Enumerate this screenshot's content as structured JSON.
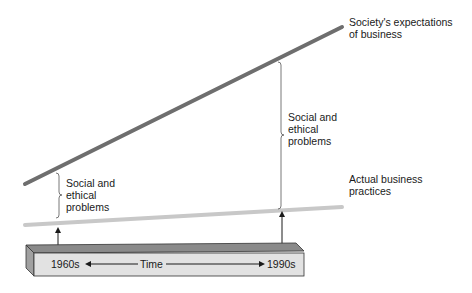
{
  "diagram": {
    "lines": {
      "expectations": {
        "label": "Society's expectations\nof business",
        "color": "#6e6e6e"
      },
      "practices": {
        "label": "Actual business\npractices",
        "color": "#c8c8c8"
      }
    },
    "gaps": [
      {
        "label": "Social and\nethical\nproblems",
        "era": "1960s"
      },
      {
        "label": "Social and\nethical\nproblems",
        "era": "1990s"
      }
    ],
    "timeline": {
      "start": "1960s",
      "middle": "Time",
      "end": "1990s"
    }
  }
}
